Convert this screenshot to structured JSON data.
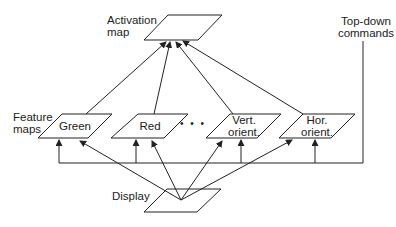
{
  "labels": {
    "activation_map_line1": "Activation",
    "activation_map_line2": "map",
    "top_down_line1": "Top-down",
    "top_down_line2": "commands",
    "feature_maps_line1": "Feature",
    "feature_maps_line2": "maps",
    "display": "Display"
  },
  "feature_maps": [
    {
      "name": "green",
      "line1": "Green",
      "line2": ""
    },
    {
      "name": "red",
      "line1": "Red",
      "line2": ""
    },
    {
      "name": "vert-orient",
      "line1": "Vert.",
      "line2": "orient."
    },
    {
      "name": "hor-orient",
      "line1": "Hor.",
      "line2": "orient."
    }
  ],
  "ellipsis": "• • •",
  "colors": {
    "stroke": "#222222",
    "background": "#ffffff"
  }
}
